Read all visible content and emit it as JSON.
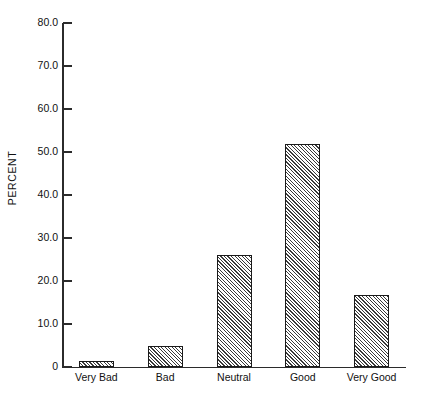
{
  "chart_data": {
    "type": "bar",
    "title": "",
    "xlabel": "",
    "ylabel": "PERCENT",
    "categories": [
      "Very Bad",
      "Bad",
      "Neutral",
      "Good",
      "Very Good"
    ],
    "values": [
      1.5,
      4.9,
      26.0,
      51.9,
      16.7
    ],
    "ylim": [
      0,
      80
    ],
    "yticks": [
      0,
      10,
      20,
      30,
      40,
      50,
      60,
      70,
      80
    ],
    "ytick_labels": [
      "0",
      "10.0",
      "20.0",
      "30.0",
      "40.0",
      "50.0",
      "60.0",
      "70.0",
      "80.0"
    ],
    "grid": false,
    "legend": false,
    "bar_fill": "diagonal-hatch",
    "colors": {
      "axis": "#2b2b2b",
      "bar_edge": "#1a1a1a",
      "bar_hatch": "#3a3a3a",
      "background": "#ffffff",
      "text": "#111111"
    }
  }
}
